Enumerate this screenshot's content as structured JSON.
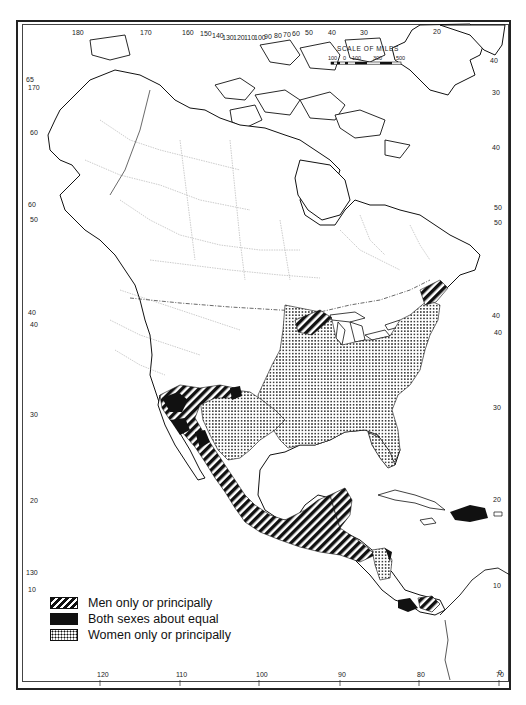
{
  "map": {
    "type": "thematic-map",
    "region": "North America, Central America and Caribbean",
    "style": "black-and-white cartographic line map with patterned fills"
  },
  "scale_bar": {
    "title": "SCALE OF MILES",
    "ticks": [
      "100",
      "0",
      "100",
      "300",
      "500"
    ]
  },
  "legend": {
    "items": [
      {
        "pattern": "diagonal-hatch",
        "label": "Men only or principally"
      },
      {
        "pattern": "solid-black",
        "label": "Both sexes about equal"
      },
      {
        "pattern": "stipple-dots",
        "label": "Women only or principally"
      }
    ]
  },
  "graticule": {
    "top_longitudes": [
      "180",
      "170",
      "160",
      "150",
      "140",
      "130",
      "120",
      "110",
      "100",
      "90",
      "80",
      "70",
      "60",
      "50",
      "40",
      "30",
      "20"
    ],
    "bottom_longitudes": [
      "120",
      "110",
      "100",
      "90",
      "80",
      "70"
    ],
    "left_latitudes": [
      "65",
      "170",
      "60",
      "60",
      "50",
      "50",
      "40",
      "40",
      "30",
      "20",
      "130",
      "10"
    ],
    "right_latitudes": [
      "40",
      "30",
      "40",
      "50",
      "50",
      "40",
      "40",
      "30",
      "20",
      "10",
      "0"
    ]
  },
  "colors": {
    "ink": "#111111",
    "paper": "#ffffff",
    "boundary": "#888888"
  }
}
